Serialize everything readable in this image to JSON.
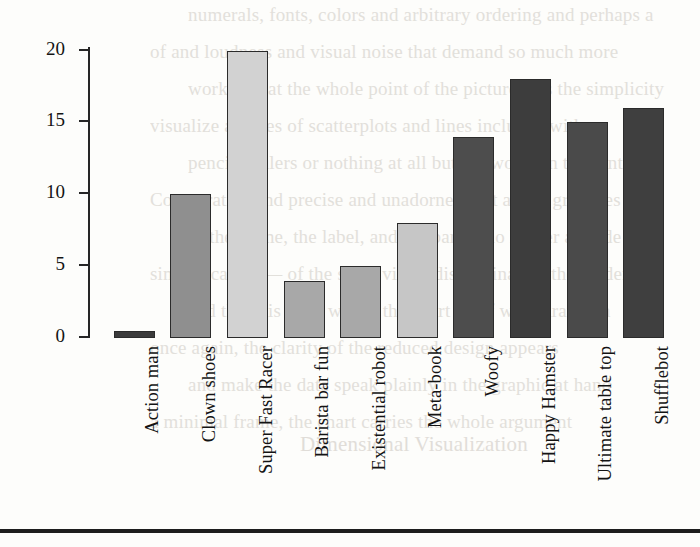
{
  "figure": {
    "y_axis_title": "Units sold (in thousands)",
    "y_tick_labels": [
      "0",
      "5",
      "10",
      "15",
      "20"
    ]
  },
  "ghost_text": {
    "lines": [
      "numerals, fonts, colors and arbitrary ordering and perhaps a",
      "of and loudness and visual noise that demand so much more",
      "work in that the whole point of the picture was the simplicity",
      "visualize a series of scatterplots and lines included with a",
      "pencils, rulers or nothing at all but the words in the sentence",
      "Comparative and precise and unadorned text as the gridlines",
      "of the frame, the label, and the bar — no longer a guide but",
      "simplification — of the same visual discrimination the reader",
      "and the axis lines within the chart itself were drawn in",
      "once again, the clarity of the reduced design appears",
      "and make the data speak plainly in the graphic at hand",
      "a minimal frame, the chart carries the whole argument",
      "Dimensional Visualization"
    ]
  },
  "chart_data": {
    "type": "bar",
    "title": "",
    "xlabel": "",
    "ylabel": "Units sold (in thousands)",
    "ylim": [
      0,
      20.6
    ],
    "yticks": [
      0,
      5,
      10,
      15,
      20
    ],
    "grid": false,
    "legend": "none",
    "categories": [
      "Action man",
      "Clown shoes",
      "Super Fast Racer",
      "Barista bar fun",
      "Existential robot",
      "Meta-book",
      "Woofy",
      "Happy Hamster",
      "Ultimate table top",
      "Shufflebot"
    ],
    "values": [
      0.5,
      10,
      20,
      4,
      5,
      8,
      14,
      18,
      15,
      16
    ],
    "bar_colors": [
      "#3b3b3b",
      "#8f8f8f",
      "#d2d2d2",
      "#a8a8a8",
      "#a8a8a8",
      "#c6c6c6",
      "#4d4d4d",
      "#3d3d3d",
      "#4a4a4a",
      "#3f3f3f"
    ],
    "bar_edge_color": "#2b2b2b",
    "axis_color": "#262626"
  }
}
